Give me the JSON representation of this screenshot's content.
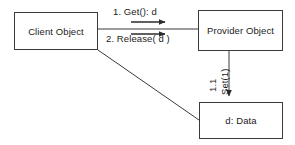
{
  "diagram": {
    "type": "uml-collaboration-diagram",
    "background_color": "#ffffff",
    "line_color": "#3a3a3a",
    "text_color": "#1b1b1b",
    "nodes": [
      {
        "id": "client",
        "label": "Client Object"
      },
      {
        "id": "provider",
        "label": "Provider Object"
      },
      {
        "id": "data",
        "label": "d: Data"
      }
    ],
    "edges": [
      {
        "id": "get",
        "from": "client",
        "to": "provider",
        "label": "1. Get(): d",
        "direction": "right"
      },
      {
        "id": "release",
        "from": "client",
        "to": "provider",
        "label": "2. Release( d )",
        "direction": "right"
      },
      {
        "id": "set",
        "from": "provider",
        "to": "data",
        "sequence": "1.1",
        "label": "Set(1)",
        "direction": "down"
      },
      {
        "id": "client-data-link",
        "from": "client",
        "to": "data",
        "label": "",
        "direction": "none"
      }
    ]
  }
}
